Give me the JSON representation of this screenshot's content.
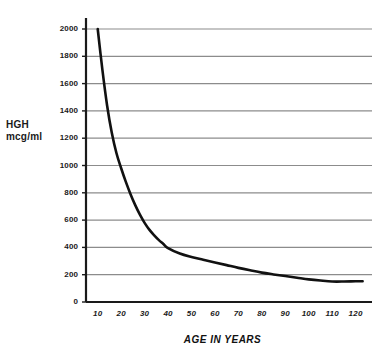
{
  "chart_data": {
    "type": "line",
    "title": "",
    "xlabel": "AGE IN YEARS",
    "ylabel": "HGH mcg/ml",
    "ylabel_line1": "HGH",
    "ylabel_line2": "mcg/ml",
    "xlim": [
      5,
      127
    ],
    "ylim": [
      0,
      2000
    ],
    "grid": true,
    "legend": null,
    "gridline_color": "#8c8c8c",
    "axis_color": "#1a1a1a",
    "series_color": "#111111",
    "yticks": [
      0,
      200,
      400,
      600,
      800,
      1000,
      1200,
      1400,
      1600,
      1800,
      2000
    ],
    "ytick_labels": [
      "0",
      "200",
      "400",
      "600",
      "800",
      "1000",
      "1200",
      "1400",
      "1600",
      "1800",
      "2000"
    ],
    "xticks": [
      10,
      20,
      30,
      40,
      50,
      60,
      70,
      80,
      90,
      100,
      110,
      120
    ],
    "xtick_labels": [
      "10",
      "20",
      "30",
      "40",
      "50",
      "60",
      "70",
      "80",
      "90",
      "100",
      "110",
      "120"
    ],
    "series": [
      {
        "name": "HGH",
        "x": [
          10,
          12,
          14,
          16,
          18,
          20,
          22,
          24,
          26,
          28,
          30,
          32,
          34,
          36,
          38,
          40,
          45,
          50,
          55,
          60,
          65,
          70,
          75,
          80,
          85,
          90,
          95,
          100,
          105,
          110,
          115,
          120,
          123
        ],
        "values": [
          2000,
          1700,
          1440,
          1240,
          1090,
          980,
          880,
          790,
          710,
          640,
          580,
          530,
          490,
          455,
          425,
          395,
          355,
          330,
          310,
          290,
          270,
          250,
          232,
          215,
          202,
          190,
          178,
          166,
          157,
          150,
          150,
          152,
          152
        ]
      }
    ]
  }
}
